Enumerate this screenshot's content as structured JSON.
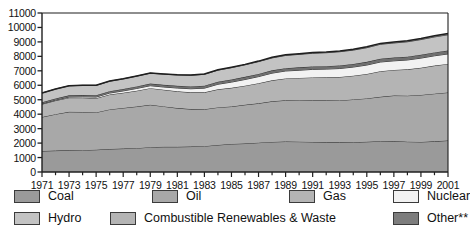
{
  "chart_data": {
    "type": "area",
    "stacked": true,
    "title": "",
    "xlabel": "",
    "ylabel": "",
    "ylim": [
      0,
      11000
    ],
    "ytick_step": 1000,
    "yticks": [
      0,
      1000,
      2000,
      3000,
      4000,
      5000,
      6000,
      7000,
      8000,
      9000,
      10000,
      11000
    ],
    "xlim": [
      1971,
      2001
    ],
    "x": [
      1971,
      1972,
      1973,
      1974,
      1975,
      1976,
      1977,
      1978,
      1979,
      1980,
      1981,
      1982,
      1983,
      1984,
      1985,
      1986,
      1987,
      1988,
      1989,
      1990,
      1991,
      1992,
      1993,
      1994,
      1995,
      1996,
      1997,
      1998,
      1999,
      2000,
      2001
    ],
    "xtick_labels": [
      "1971",
      "1973",
      "1975",
      "1977",
      "1979",
      "1981",
      "1983",
      "1985",
      "1987",
      "1989",
      "1991",
      "1993",
      "1995",
      "1997",
      "1999",
      "2001"
    ],
    "xtick_values": [
      1971,
      1973,
      1975,
      1977,
      1979,
      1981,
      1983,
      1985,
      1987,
      1989,
      1991,
      1993,
      1995,
      1997,
      1999,
      2001
    ],
    "grid": false,
    "legend_position": "bottom",
    "series": [
      {
        "name": "Coal",
        "color": "#9a9a9a",
        "values": [
          1450,
          1480,
          1500,
          1510,
          1540,
          1590,
          1620,
          1650,
          1720,
          1740,
          1740,
          1760,
          1790,
          1870,
          1940,
          1970,
          2030,
          2080,
          2110,
          2100,
          2080,
          2050,
          2050,
          2060,
          2090,
          2130,
          2140,
          2100,
          2080,
          2120,
          2180
        ]
      },
      {
        "name": "Oil",
        "color": "#a8a8a8",
        "values": [
          2350,
          2520,
          2660,
          2640,
          2580,
          2740,
          2810,
          2880,
          2930,
          2800,
          2680,
          2590,
          2550,
          2600,
          2590,
          2680,
          2720,
          2810,
          2850,
          2870,
          2880,
          2910,
          2900,
          2960,
          3000,
          3070,
          3150,
          3180,
          3250,
          3300,
          3320
        ]
      },
      {
        "name": "Gas",
        "color": "#b4b4b4",
        "values": [
          890,
          940,
          980,
          990,
          980,
          1030,
          1050,
          1090,
          1150,
          1150,
          1160,
          1160,
          1170,
          1250,
          1290,
          1320,
          1390,
          1450,
          1510,
          1540,
          1580,
          1590,
          1620,
          1640,
          1690,
          1770,
          1770,
          1820,
          1880,
          1940,
          1980
        ]
      },
      {
        "name": "Nuclear",
        "color": "#f2f2f2",
        "values": [
          29,
          39,
          49,
          62,
          85,
          102,
          130,
          160,
          170,
          190,
          230,
          250,
          290,
          350,
          400,
          430,
          460,
          500,
          520,
          530,
          560,
          570,
          590,
          600,
          620,
          640,
          630,
          650,
          670,
          680,
          690
        ]
      },
      {
        "name": "Hydro",
        "color": "#6f6f6f",
        "values": [
          104,
          110,
          114,
          124,
          127,
          129,
          134,
          143,
          148,
          152,
          156,
          160,
          170,
          176,
          180,
          184,
          187,
          194,
          193,
          199,
          204,
          203,
          212,
          214,
          220,
          226,
          227,
          230,
          233,
          235,
          237
        ]
      },
      {
        "name": "Combustible Renewables & Waste",
        "color": "#c3c3c3",
        "values": [
          640,
          650,
          660,
          670,
          680,
          690,
          700,
          710,
          720,
          740,
          750,
          770,
          790,
          800,
          820,
          830,
          850,
          860,
          880,
          900,
          910,
          930,
          950,
          960,
          980,
          1000,
          1010,
          1030,
          1050,
          1070,
          1090
        ]
      },
      {
        "name": "Other**",
        "color": "#7d7d7d",
        "values": [
          4,
          5,
          6,
          7,
          8,
          9,
          10,
          12,
          14,
          16,
          18,
          20,
          23,
          26,
          29,
          32,
          35,
          38,
          41,
          44,
          47,
          50,
          53,
          56,
          59,
          62,
          65,
          68,
          71,
          74,
          77
        ]
      }
    ]
  },
  "axes": {
    "y_labels": [
      "11000",
      "10000",
      "9000",
      "8000",
      "7000",
      "6000",
      "5000",
      "4000",
      "3000",
      "2000",
      "1000",
      "0"
    ],
    "x_labels": [
      "1971",
      "1973",
      "1975",
      "1977",
      "1979",
      "1981",
      "1983",
      "1985",
      "1987",
      "1989",
      "1991",
      "1993",
      "1995",
      "1997",
      "1999",
      "2001"
    ]
  },
  "legend": {
    "items": [
      {
        "label": "Coal",
        "color": "#9a9a9a"
      },
      {
        "label": "Oil",
        "color": "#a8a8a8"
      },
      {
        "label": "Gas",
        "color": "#b4b4b4"
      },
      {
        "label": "Nuclear",
        "color": "#f2f2f2"
      },
      {
        "label": "Hydro",
        "color": "#c3c3c3"
      },
      {
        "label": "Combustible Renewables & Waste",
        "color": "#b4b4b4"
      },
      {
        "label": "Other**",
        "color": "#7d7d7d"
      }
    ]
  }
}
